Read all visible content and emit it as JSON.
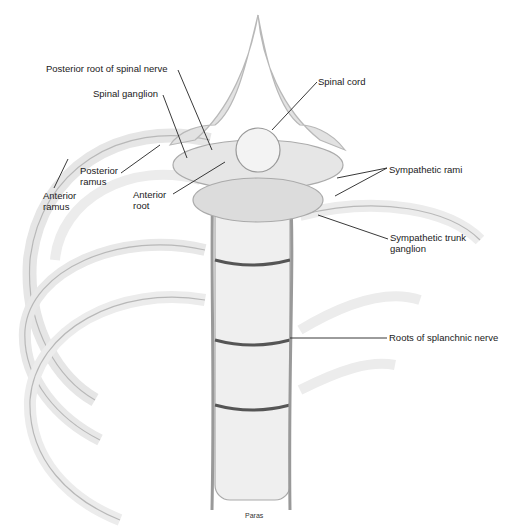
{
  "diagram": {
    "labels": [
      {
        "id": "posterior-root",
        "text": "Posterior root of spinal nerve",
        "x": 46,
        "y": 63
      },
      {
        "id": "spinal-ganglion",
        "text": "Spinal ganglion",
        "x": 93,
        "y": 88
      },
      {
        "id": "spinal-cord",
        "text": "Spinal cord",
        "x": 318,
        "y": 76
      },
      {
        "id": "posterior-ramus-1",
        "text": "Posterior",
        "x": 80,
        "y": 165
      },
      {
        "id": "posterior-ramus-2",
        "text": "ramus",
        "x": 80,
        "y": 176
      },
      {
        "id": "anterior-ramus-1",
        "text": "Anterior",
        "x": 43,
        "y": 190
      },
      {
        "id": "anterior-ramus-2",
        "text": "ramus",
        "x": 43,
        "y": 201
      },
      {
        "id": "anterior-root-1",
        "text": "Anterior",
        "x": 133,
        "y": 189
      },
      {
        "id": "anterior-root-2",
        "text": "root",
        "x": 133,
        "y": 200
      },
      {
        "id": "sympathetic-rami",
        "text": "Sympathetic rami",
        "x": 389,
        "y": 164
      },
      {
        "id": "sympathetic-trunk-1",
        "text": "Sympathetic trunk",
        "x": 390,
        "y": 232
      },
      {
        "id": "sympathetic-trunk-2",
        "text": "ganglion",
        "x": 390,
        "y": 243
      },
      {
        "id": "splanchnic",
        "text": "Roots of splanchnic nerve",
        "x": 389,
        "y": 332
      }
    ],
    "credit": "Paras"
  }
}
